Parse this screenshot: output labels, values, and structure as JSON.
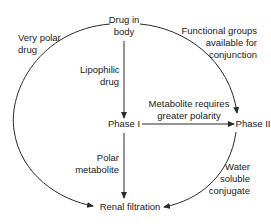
{
  "diagram": {
    "nodes": {
      "drug_in_body": [
        "Drug in",
        "body"
      ],
      "phase1": "Phase I",
      "phase2": "Phase II",
      "renal": "Renal filtration"
    },
    "edge_labels": {
      "very_polar": [
        "Very polar",
        "drug"
      ],
      "lipophilic": [
        "Lipophilic",
        "drug"
      ],
      "functional_groups": [
        "Functional groups",
        "available for",
        "conjunction"
      ],
      "metabolite_requires": [
        "Metabolite requires",
        "greater polarity"
      ],
      "polar_metabolite": [
        "Polar",
        "metabolite"
      ],
      "water_soluble": [
        "Water",
        "soluble",
        "conjugate"
      ]
    },
    "edges": [
      {
        "from": "Drug in body",
        "to": "Renal filtration",
        "label": "Very polar drug"
      },
      {
        "from": "Drug in body",
        "to": "Phase I",
        "label": "Lipophilic drug"
      },
      {
        "from": "Drug in body",
        "to": "Phase II",
        "label": "Functional groups available for conjunction"
      },
      {
        "from": "Phase I",
        "to": "Phase II",
        "label": "Metabolite requires greater polarity"
      },
      {
        "from": "Phase I",
        "to": "Renal filtration",
        "label": "Polar metabolite"
      },
      {
        "from": "Phase II",
        "to": "Renal filtration",
        "label": "Water soluble conjugate"
      }
    ],
    "colors": {
      "stroke": "#2a2a2a",
      "text": "#1a1a1a",
      "background": "#ffffff"
    }
  }
}
